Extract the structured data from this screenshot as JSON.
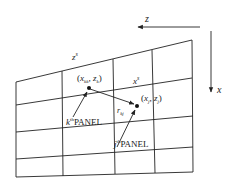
{
  "diagram": {
    "axes": {
      "z_label": "z",
      "x_label": "x"
    },
    "surface_labels": {
      "z_s": "z",
      "z_s_sup": "s",
      "x_s": "x",
      "x_s_sup": "s"
    },
    "points": {
      "k": {
        "coord_open": "(",
        "x": "x",
        "x_sub": "kk",
        "comma": ", ",
        "z": "z",
        "z_sub": "k",
        "coord_close": ")"
      },
      "j": {
        "coord_open": "(",
        "x": "x",
        "x_sub": "j",
        "comma": ", ",
        "z": "z",
        "z_sub": "j",
        "coord_close": ")"
      }
    },
    "distance_label": {
      "r": "r",
      "sub": "kj"
    },
    "panels": {
      "k": {
        "index": "k",
        "sup": "th",
        "text": "PANEL"
      },
      "j": {
        "index": "j",
        "sup": "th",
        "text": "PANEL"
      }
    },
    "colors": {
      "line": "#222222",
      "background": "#ffffff"
    }
  }
}
